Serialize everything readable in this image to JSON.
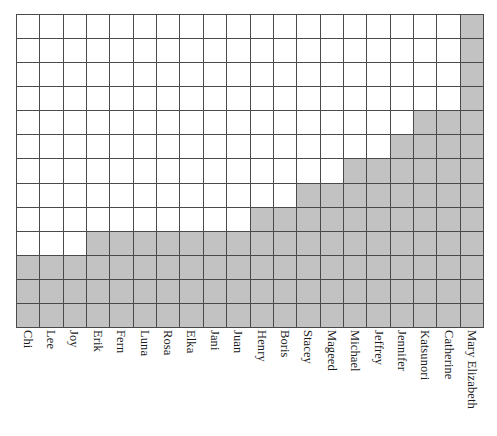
{
  "chart_data": {
    "type": "bar",
    "title": "",
    "subtitle": "",
    "xlabel": "",
    "ylabel": "",
    "grid": true,
    "legend": null,
    "legend_position": "none",
    "render_style": "gridded-block-bar",
    "grid_rows": 13,
    "grid_columns": 20,
    "ylim": [
      0,
      13
    ],
    "yticks": [],
    "fill_color": "#c2c2c2",
    "grid_line_color": "#4a4a4a",
    "background_color": "#ffffff",
    "label_rotation_degrees": 90,
    "categories": [
      "Chi",
      "Lee",
      "Joy",
      "Erik",
      "Fern",
      "Luna",
      "Rosa",
      "Elka",
      "Jani",
      "Juan",
      "Henry",
      "Boris",
      "Stacey",
      "Mageed",
      "Michael",
      "Jeffrey",
      "Jennifer",
      "Katsunori",
      "Catherine",
      "Mary Elizabeth"
    ],
    "values": [
      3,
      3,
      3,
      4,
      4,
      4,
      4,
      4,
      4,
      4,
      5,
      5,
      6,
      6,
      7,
      7,
      8,
      9,
      9,
      13
    ]
  }
}
